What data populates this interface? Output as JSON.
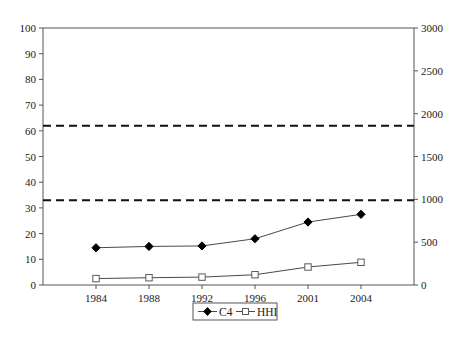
{
  "chart_data": {
    "type": "line",
    "title": "",
    "subtitle": "",
    "xlabel": "",
    "ylabel": "",
    "y2label": "",
    "categories": [
      "1984",
      "1988",
      "1992",
      "1996",
      "2001",
      "2004"
    ],
    "x": [
      1984,
      1988,
      1992,
      1996,
      2001,
      2004
    ],
    "ylim": [
      0,
      100
    ],
    "y2lim": [
      0,
      3000
    ],
    "yticks": [
      0,
      10,
      20,
      30,
      40,
      50,
      60,
      70,
      80,
      90,
      100
    ],
    "ytick_labels": [
      "0",
      "10",
      "20",
      "30",
      "40",
      "50",
      "60",
      "70",
      "80",
      "90",
      "100"
    ],
    "y2ticks": [
      0,
      500,
      1000,
      1500,
      2000,
      2500,
      3000
    ],
    "y2tick_labels": [
      "0",
      "500",
      "1000",
      "1500",
      "2000",
      "2500",
      "3000"
    ],
    "grid": false,
    "legend_position": "bottom-center",
    "series": [
      {
        "name": "C4",
        "axis": "left",
        "marker": "filled-diamond",
        "values": [
          14.5,
          15.0,
          15.2,
          18.0,
          24.5,
          27.5
        ]
      },
      {
        "name": "HHI",
        "axis": "right",
        "marker": "open-square",
        "values": [
          75,
          85,
          92,
          120,
          210,
          265
        ]
      }
    ],
    "reference_lines": [
      {
        "name": "upper-threshold",
        "left_value": 62,
        "right_value": 1860,
        "style": "dashed"
      },
      {
        "name": "lower-threshold",
        "left_value": 33,
        "right_value": 990,
        "style": "dashed"
      }
    ],
    "colors": {
      "c4_marker": "#000000",
      "hhi_marker": "#ffffff",
      "line": "#4a4a4a",
      "axis": "#555555",
      "reference_line": "#111111",
      "background": "#ffffff"
    }
  },
  "legend": {
    "items": [
      {
        "label": "C4",
        "marker": "filled-diamond"
      },
      {
        "label": "HHI",
        "marker": "open-square"
      }
    ]
  }
}
